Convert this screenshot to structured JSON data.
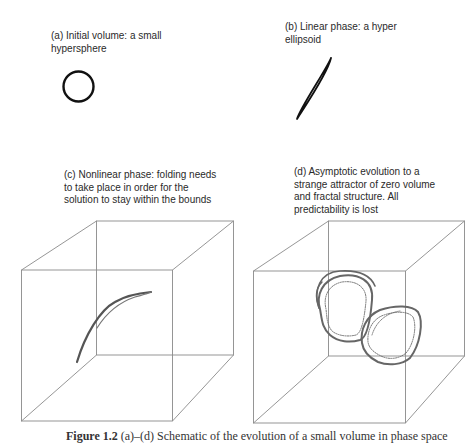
{
  "panels": {
    "a": {
      "label": "(a) Initial volume: a small\nhypersphere",
      "shape": "circle"
    },
    "b": {
      "label": "(b) Linear phase: a hyper\nellipsoid",
      "shape": "thin-ellipse"
    },
    "c": {
      "label": "(c) Nonlinear phase: folding needs\nto take place in order for the\nsolution to stay within the bounds",
      "shape": "folded-curve-in-cube"
    },
    "d": {
      "label": "(d) Asymptotic evolution to a\nstrange attractor of zero volume\nand fractal structure. All\npredictability is lost",
      "shape": "strange-attractor-in-cube"
    }
  },
  "caption": {
    "figure_number": "Figure 1.2",
    "text": "(a)–(d) Schematic of the evolution of a small volume in phase space"
  },
  "colors": {
    "line": "#111111",
    "cube": "#8a8a8a",
    "attractor": "#666666"
  }
}
